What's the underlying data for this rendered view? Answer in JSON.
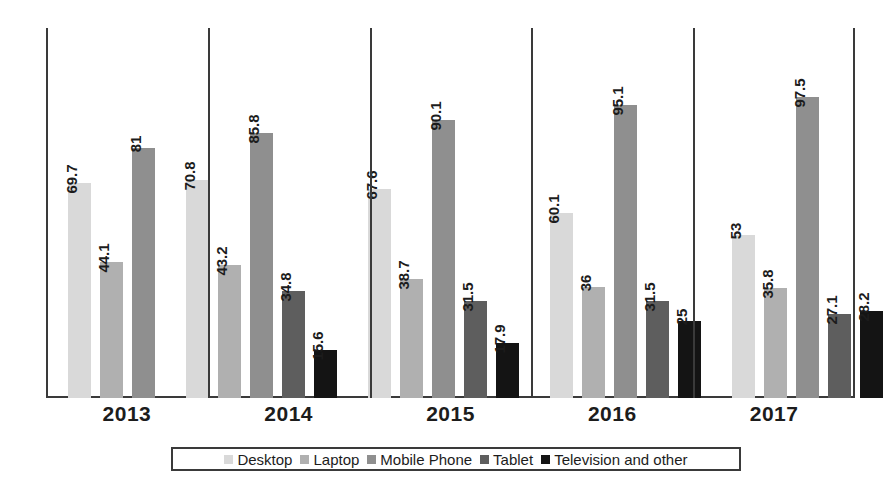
{
  "chart_data": {
    "type": "bar",
    "title": "",
    "xlabel": "",
    "ylabel": "",
    "categories": [
      "2013",
      "2014",
      "2015",
      "2016",
      "2017"
    ],
    "ylim": [
      0,
      100
    ],
    "grid": false,
    "legend_position": "bottom",
    "series": [
      {
        "name": "Desktop",
        "color": "#d9d9d9",
        "values": [
          69.7,
          70.8,
          67.6,
          60.1,
          53
        ],
        "labels": [
          "69.7",
          "70.8",
          "67.6",
          "60.1",
          "53"
        ]
      },
      {
        "name": "Laptop",
        "color": "#b0b0b0",
        "values": [
          44.1,
          43.2,
          38.7,
          36,
          35.8
        ],
        "labels": [
          "44.1",
          "43.2",
          "38.7",
          "36",
          "35.8"
        ]
      },
      {
        "name": "Mobile Phone",
        "color": "#8f8f8f",
        "values": [
          81,
          85.8,
          90.1,
          95.1,
          97.5
        ],
        "labels": [
          "81",
          "85.8",
          "90.1",
          "95.1",
          "97.5"
        ]
      },
      {
        "name": "Tablet",
        "color": "#5e5e5e",
        "values": [
          null,
          34.8,
          31.5,
          31.5,
          27.1
        ],
        "labels": [
          "",
          "34.8",
          "31.5",
          "31.5",
          "27.1"
        ]
      },
      {
        "name": "Television and other",
        "color": "#141414",
        "values": [
          null,
          15.6,
          17.9,
          25,
          28.2
        ],
        "labels": [
          "",
          "15.6",
          "17.9",
          "25",
          "28.2"
        ]
      }
    ]
  },
  "legend": {
    "items": [
      {
        "label": "Desktop",
        "color": "#d9d9d9"
      },
      {
        "label": "Laptop",
        "color": "#b0b0b0"
      },
      {
        "label": "Mobile Phone",
        "color": "#8f8f8f"
      },
      {
        "label": "Tablet",
        "color": "#5e5e5e"
      },
      {
        "label": "Television and other",
        "color": "#141414"
      }
    ]
  },
  "axes": {
    "frame_color": "#3a3a3a",
    "x_tick_labels": [
      "2013",
      "2014",
      "2015",
      "2016",
      "2017"
    ]
  }
}
